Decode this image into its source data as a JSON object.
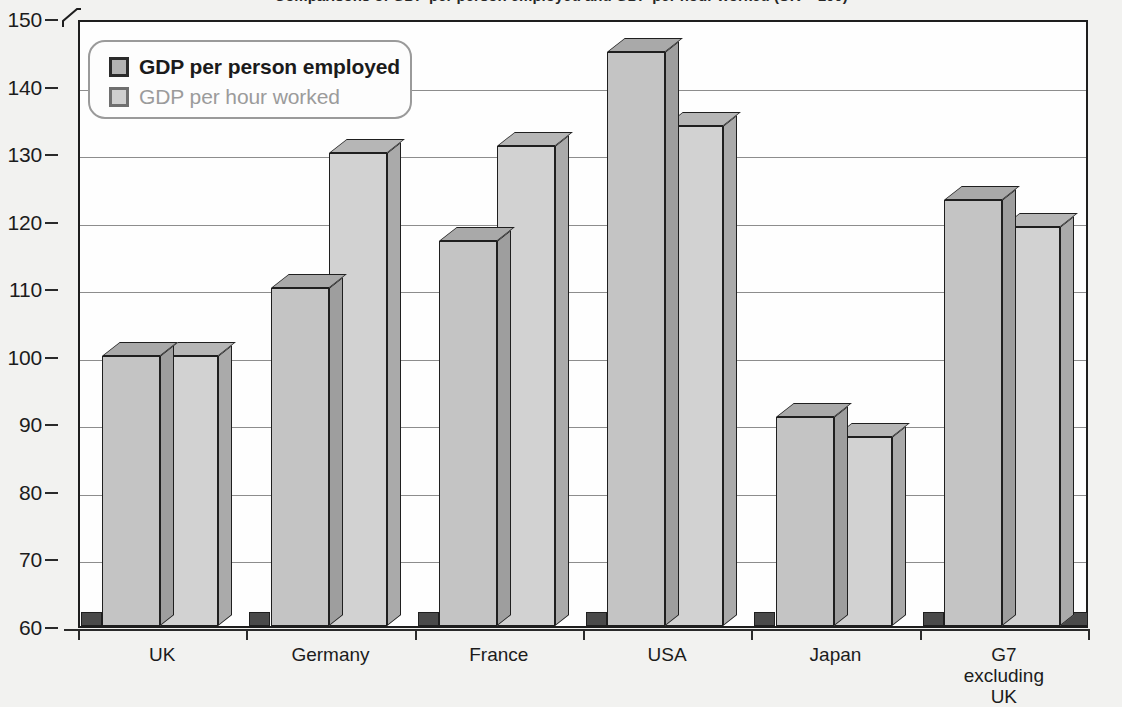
{
  "title": "Comparisons of GDP per person employed and GDP per hour worked (UK = 100)",
  "legend": {
    "items": [
      {
        "label": "GDP per person employed",
        "swatch": "legend-swatch-series-1"
      },
      {
        "label": "GDP per hour worked",
        "swatch": "legend-swatch-series-2"
      }
    ]
  },
  "axis": {
    "y_ticks": [
      "150",
      "140",
      "130",
      "120",
      "110",
      "100",
      "90",
      "80",
      "70",
      "60"
    ],
    "x_labels": [
      "UK",
      "Germany",
      "France",
      "USA",
      "Japan",
      "G7\nexcluding\nUK"
    ]
  },
  "colors": {
    "series1_face": "#c4c4c4",
    "series2_face": "#d2d2d2",
    "outline": "#1f1f1f",
    "gridline": "#8d8d8d",
    "floor": "#4a4a4a",
    "plot_background": "#fefefe",
    "page_background": "#f2f2f0"
  },
  "chart_data": {
    "type": "bar",
    "title": "Comparisons of GDP per person employed and GDP per hour worked (UK = 100)",
    "xlabel": "",
    "ylabel": "",
    "ylim": [
      60,
      150
    ],
    "ytick_step": 10,
    "grid": true,
    "legend_position": "top-left",
    "categories": [
      "UK",
      "Germany",
      "France",
      "USA",
      "Japan",
      "G7 excluding UK"
    ],
    "series": [
      {
        "name": "GDP per person employed",
        "values": [
          100,
          110,
          117,
          145,
          91,
          123
        ]
      },
      {
        "name": "GDP per hour worked",
        "values": [
          100,
          130,
          131,
          134,
          88,
          119
        ]
      }
    ]
  }
}
